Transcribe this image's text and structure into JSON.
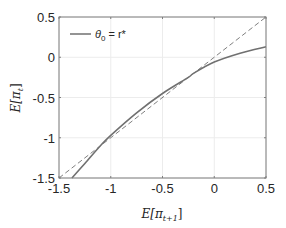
{
  "chart_data": {
    "type": "line",
    "title": "",
    "xlabel": "E[π_{t+1}]",
    "ylabel": "E[π_t]",
    "xlim": [
      -1.5,
      0.5
    ],
    "ylim": [
      -1.5,
      0.5
    ],
    "xticks": [
      -1.5,
      -1,
      -0.5,
      0,
      0.5
    ],
    "yticks": [
      -1.5,
      -1,
      -0.5,
      0,
      0.5
    ],
    "xtick_labels": [
      "-1.5",
      "-1",
      "-0.5",
      "0",
      "0.5"
    ],
    "ytick_labels": [
      "-1.5",
      "-1",
      "-0.5",
      "0",
      "0.5"
    ],
    "grid": true,
    "legend_position": "upper left",
    "series": [
      {
        "name": "θ0 = r*",
        "style": "solid",
        "color": "#707070",
        "x": [
          -1.375,
          -1.25,
          -1.1,
          -1.0,
          -0.75,
          -0.5,
          -0.25,
          -0.2,
          0.0,
          0.25,
          0.5
        ],
        "y": [
          -1.5,
          -1.32,
          -1.1,
          -0.97,
          -0.69,
          -0.45,
          -0.25,
          -0.2,
          -0.06,
          0.05,
          0.13
        ]
      },
      {
        "name": "45-degree line",
        "style": "dashed",
        "color": "#707070",
        "x": [
          -1.5,
          0.5
        ],
        "y": [
          -1.5,
          0.5
        ]
      }
    ]
  },
  "labels": {
    "legend_theta": "θ",
    "legend_sub": "0",
    "legend_rest": " = r*",
    "xlabel_main": "E[π",
    "xlabel_sub": "t+1",
    "xlabel_end": "]",
    "ylabel_main": "E[π",
    "ylabel_sub": "t",
    "ylabel_end": "]"
  },
  "colors": {
    "axis": "#7f7f7f",
    "grid": "#ececec",
    "curve": "#707070",
    "dashed": "#808080"
  }
}
